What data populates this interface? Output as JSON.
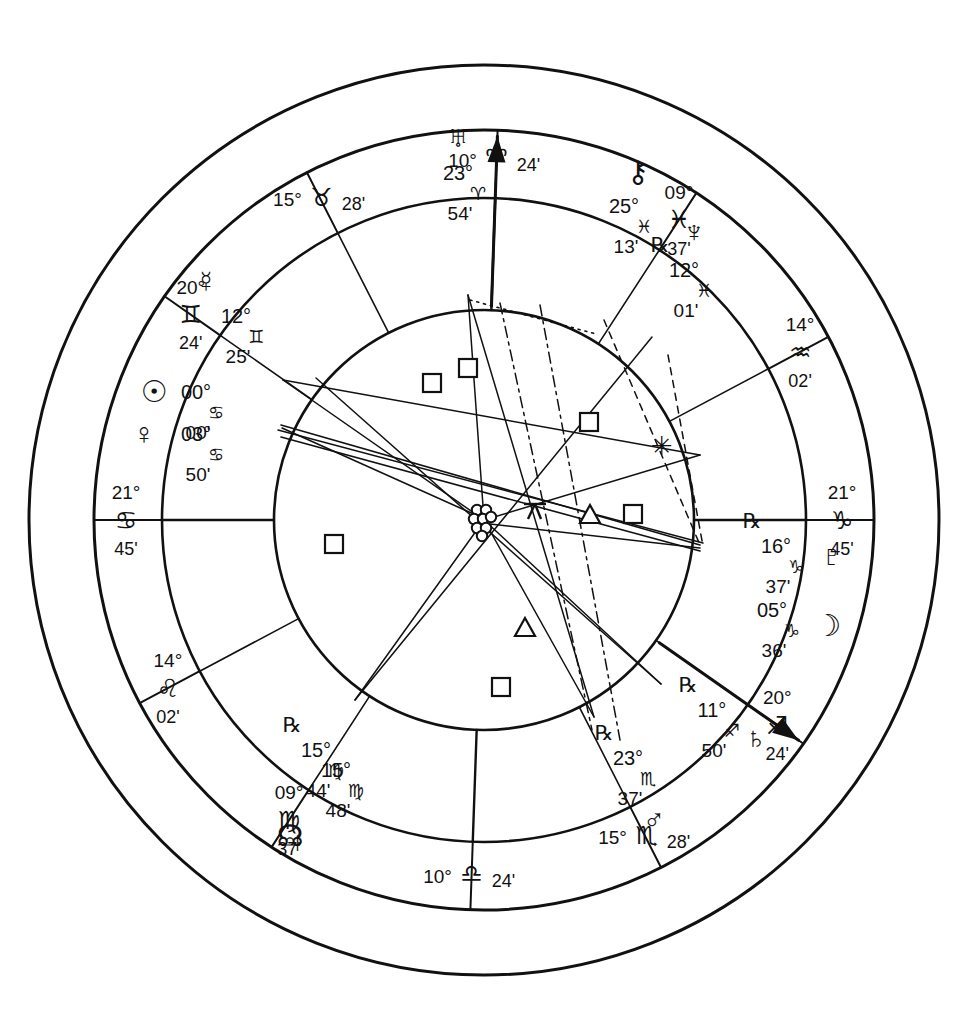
{
  "chart_data": {
    "type": "scatter",
    "subtitle": "Zodiac wheel with house cusps, planetary placements and aspect lines",
    "grid": false,
    "legend_position": "none",
    "wheel": {
      "center_x": 484,
      "center_y": 520,
      "r_outer": 455,
      "r_sign_ring": 390,
      "r_house_ring": 322,
      "r_inner": 210,
      "ascendant_degree": 111.75,
      "rotation_note": "Ascendant 21 Cancer 45 placed at left horizon"
    },
    "glyphs": {
      "aries": "♈",
      "taurus": "♉",
      "gemini": "♊",
      "cancer": "♋",
      "leo": "♌",
      "virgo": "♍",
      "libra": "♎",
      "scorpio": "♏",
      "sagittarius": "♐",
      "capricorn": "♑",
      "aquarius": "♒",
      "pisces": "♓",
      "sun": "☉",
      "moon": "☽",
      "mercury": "☿",
      "venus": "♀",
      "mars": "♂",
      "jupiter": "♃",
      "saturn": "♄",
      "uranus": "♅",
      "neptune": "♆",
      "pluto": "♇",
      "chiron": "⚷",
      "north_node": "☊",
      "retrograde": "℞",
      "conjunction": "☌",
      "opposition": "☍",
      "square": "□",
      "trine": "△",
      "sextile": "✳",
      "sesquiquadrate": "⚼"
    },
    "cusps": [
      {
        "id": "cusp-asc",
        "deg": "21°",
        "sign": "cancer",
        "min": "45'",
        "angle_deg": 180,
        "label_r": 358,
        "side": "left"
      },
      {
        "id": "cusp-2",
        "deg": "14°",
        "sign": "leo",
        "min": "02'",
        "angle_deg": 208,
        "label_r": 358,
        "side": "left"
      },
      {
        "id": "cusp-3",
        "deg": "09°",
        "sign": "virgo",
        "min": "37'",
        "angle_deg": 237,
        "label_r": 358,
        "side": "left"
      },
      {
        "id": "cusp-ic",
        "deg": "10°",
        "sign": "libra",
        "min": "24'",
        "angle_deg": 268,
        "label_r": 358,
        "side": "bottom"
      },
      {
        "id": "cusp-5",
        "deg": "15°",
        "sign": "scorpio",
        "min": "28'",
        "angle_deg": 297,
        "label_r": 358,
        "side": "bottom"
      },
      {
        "id": "cusp-6",
        "deg": "20°",
        "sign": "sagittarius",
        "min": "24'",
        "angle_deg": 325,
        "label_r": 358,
        "side": "right"
      },
      {
        "id": "cusp-dsc",
        "deg": "21°",
        "sign": "capricorn",
        "min": "45'",
        "angle_deg": 0,
        "label_r": 358,
        "side": "right"
      },
      {
        "id": "cusp-8",
        "deg": "14°",
        "sign": "aquarius",
        "min": "02'",
        "angle_deg": 28,
        "label_r": 358,
        "side": "right"
      },
      {
        "id": "cusp-9",
        "deg": "09°",
        "sign": "pisces",
        "min": "37'",
        "angle_deg": 57,
        "label_r": 358,
        "side": "right"
      },
      {
        "id": "cusp-mc",
        "deg": "10°",
        "sign": "aries",
        "min": "24'",
        "angle_deg": 88,
        "label_r": 358,
        "side": "top"
      },
      {
        "id": "cusp-11",
        "deg": "15°",
        "sign": "taurus",
        "min": "28'",
        "angle_deg": 117,
        "label_r": 358,
        "side": "top"
      },
      {
        "id": "cusp-12",
        "deg": "20°",
        "sign": "gemini",
        "min": "24'",
        "angle_deg": 145,
        "label_r": 358,
        "side": "left"
      }
    ],
    "planets": [
      {
        "id": "uranus",
        "name": "uranus",
        "deg": "23°",
        "sign": "aries",
        "min": "54'",
        "retro": "",
        "x": 458,
        "y": 175,
        "glyph_dx": 0,
        "glyph_dy": -36
      },
      {
        "id": "chiron",
        "name": "chiron",
        "deg": "25°",
        "sign": "pisces",
        "min": "13'",
        "retro": "",
        "x": 624,
        "y": 208,
        "glyph_dx": 14,
        "glyph_dy": -34
      },
      {
        "id": "neptune",
        "name": "neptune",
        "deg": "12°",
        "sign": "pisces",
        "min": "01'",
        "retro": "℞",
        "x": 684,
        "y": 272,
        "glyph_dx": 10,
        "glyph_dy": -38
      },
      {
        "id": "pluto",
        "name": "pluto",
        "deg": "16°",
        "sign": "capricorn",
        "min": "37'",
        "retro": "℞",
        "x": 776,
        "y": 548,
        "glyph_dx": 56,
        "glyph_dy": 10
      },
      {
        "id": "moon",
        "name": "moon",
        "deg": "05°",
        "sign": "capricorn",
        "min": "36'",
        "retro": "",
        "x": 772,
        "y": 612,
        "glyph_dx": 56,
        "glyph_dy": 16
      },
      {
        "id": "saturn",
        "name": "saturn",
        "deg": "11°",
        "sign": "sagittarius",
        "min": "50'",
        "retro": "℞",
        "x": 712,
        "y": 712,
        "glyph_dx": 44,
        "glyph_dy": 28
      },
      {
        "id": "mars",
        "name": "mars",
        "deg": "23°",
        "sign": "scorpio",
        "min": "37'",
        "retro": "℞",
        "x": 628,
        "y": 760,
        "glyph_dx": 26,
        "glyph_dy": 62
      },
      {
        "id": "nnode",
        "name": "north_node",
        "deg": "15°",
        "sign": "virgo",
        "min": "48'",
        "retro": "",
        "x": 336,
        "y": 772,
        "glyph_dx": -46,
        "glyph_dy": 66
      },
      {
        "id": "jupiter",
        "name": "jupiter",
        "deg": "15°",
        "sign": "virgo",
        "min": "44'",
        "retro": "℞",
        "x": 316,
        "y": 752,
        "glyph_dx": -24,
        "glyph_dy": 92
      },
      {
        "id": "sun",
        "name": "sun",
        "deg": "00°",
        "sign": "cancer",
        "min": "00'",
        "retro": "",
        "x": 196,
        "y": 394,
        "glyph_dx": -42,
        "glyph_dy": 0
      },
      {
        "id": "venus",
        "name": "venus",
        "deg": "03°",
        "sign": "cancer",
        "min": "50'",
        "retro": "",
        "x": 196,
        "y": 436,
        "glyph_dx": -52,
        "glyph_dy": 0
      },
      {
        "id": "mercury",
        "name": "mercury",
        "deg": "12°",
        "sign": "gemini",
        "min": "25'",
        "retro": "",
        "x": 236,
        "y": 318,
        "glyph_dx": -30,
        "glyph_dy": -34
      }
    ],
    "aspect_markers": [
      {
        "id": "aspect-square-1",
        "glyph": "square",
        "x": 468,
        "y": 368
      },
      {
        "id": "aspect-square-2",
        "glyph": "square",
        "x": 432,
        "y": 383
      },
      {
        "id": "aspect-square-3",
        "glyph": "square",
        "x": 589,
        "y": 422
      },
      {
        "id": "aspect-square-4",
        "glyph": "square",
        "x": 633,
        "y": 514
      },
      {
        "id": "aspect-square-5",
        "glyph": "square",
        "x": 334,
        "y": 544
      },
      {
        "id": "aspect-square-6",
        "glyph": "square",
        "x": 501,
        "y": 687
      },
      {
        "id": "aspect-trine-1",
        "glyph": "trine",
        "x": 590,
        "y": 515
      },
      {
        "id": "aspect-trine-2",
        "glyph": "trine",
        "x": 525,
        "y": 628
      },
      {
        "id": "aspect-sextile-1",
        "glyph": "sextile",
        "x": 662,
        "y": 448
      },
      {
        "id": "aspect-sesquiquadrate-1",
        "glyph": "sesquiquadrate",
        "x": 535,
        "y": 511
      },
      {
        "id": "aspect-conjunction-hub",
        "glyph": "conjunction",
        "x": 484,
        "y": 520
      }
    ],
    "axis_arrows": [
      {
        "id": "mc-arrow",
        "from_angle": 88,
        "label": "Midheaven arrow"
      },
      {
        "id": "dsc-arrow-sagittarius",
        "from_angle": 325,
        "label": "Sagittarius cusp arrow"
      }
    ]
  },
  "meta": {
    "page_title": "Natal Chart Wheel"
  }
}
